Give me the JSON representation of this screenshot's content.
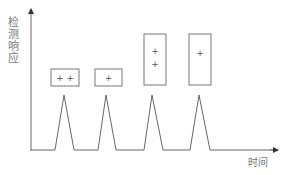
{
  "diagram": {
    "y_axis_label_chars": [
      "检",
      "测",
      "响",
      "应"
    ],
    "x_axis_label": "时间",
    "colors": {
      "line": "#666666",
      "box": "#777777",
      "text": "#777777"
    },
    "peaks": [
      {
        "start": 55,
        "apex": 64,
        "end": 74,
        "box": {
          "x": 51,
          "y": 69,
          "w": 28,
          "h": 17
        },
        "marks": [
          "+ +"
        ]
      },
      {
        "start": 98,
        "apex": 106,
        "end": 116,
        "box": {
          "x": 95,
          "y": 69,
          "w": 27,
          "h": 17
        },
        "marks": [
          "+"
        ]
      },
      {
        "start": 144,
        "apex": 152,
        "end": 163,
        "box": {
          "x": 144,
          "y": 34,
          "w": 22,
          "h": 51
        },
        "marks": [
          "+",
          "+"
        ]
      },
      {
        "start": 190,
        "apex": 199,
        "end": 210,
        "box": {
          "x": 189,
          "y": 34,
          "w": 22,
          "h": 51
        },
        "marks": [
          "+"
        ]
      }
    ],
    "box_marks": {
      "box1": "+ +",
      "box2": "+",
      "box3_top": "+",
      "box3_bottom": "+",
      "box4": "+"
    }
  }
}
